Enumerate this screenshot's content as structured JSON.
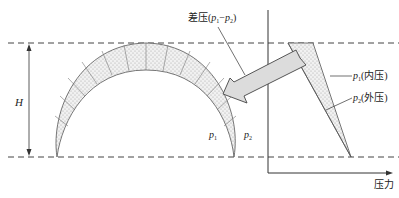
{
  "diagram": {
    "labels": {
      "height": "H",
      "differential_prefix": "差压(",
      "differential_p1": "p",
      "differential_p1_sub": "1",
      "differential_dash": "−",
      "differential_p2": "p",
      "differential_p2_sub": "2",
      "differential_suffix": ")",
      "p1_arc": "p",
      "p1_arc_sub": "1",
      "p2_arc": "p",
      "p2_arc_sub": "2",
      "inner_pressure_var": "p",
      "inner_pressure_sub": "1",
      "inner_pressure_text": "(内压)",
      "outer_pressure_var": "p",
      "outer_pressure_sub": "2",
      "outer_pressure_text": "(外压)",
      "x_axis": "压力"
    },
    "colors": {
      "line": "#333333",
      "fill": "#e6e6e6",
      "arrow_fill": "#dcdcdc"
    }
  }
}
